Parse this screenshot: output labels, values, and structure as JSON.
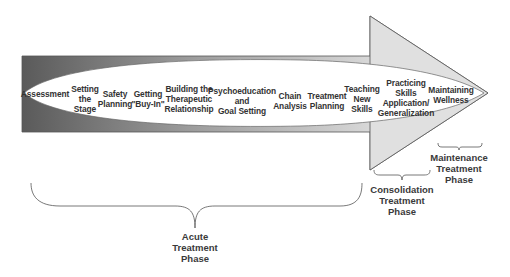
{
  "diagram": {
    "type": "arrow-process",
    "colors": {
      "shaft_dark": "#5f5f5f",
      "shaft_light": "#e6e6e6",
      "arrowhead_fill": "#e0e0e0",
      "ellipse_fill": "#ffffff",
      "outline": "#555555",
      "text": "#333333"
    },
    "steps": [
      {
        "label": "Assessment"
      },
      {
        "label": "Setting\nthe\nStage"
      },
      {
        "label": "Safety\nPlanning"
      },
      {
        "label": "Getting\n\"Buy-In\""
      },
      {
        "label": "Building the\nTherapeutic\nRelationship"
      },
      {
        "label": "Psychoeducation\nand\nGoal Setting"
      },
      {
        "label": "Chain\nAnalysis"
      },
      {
        "label": "Treatment\nPlanning"
      },
      {
        "label": "Teaching\nNew\nSkills"
      },
      {
        "label": "Practicing\nSkills\nApplication/\nGeneralization"
      },
      {
        "label": "Maintaining\nWellness"
      }
    ],
    "phases": [
      {
        "label": "Acute\nTreatment\nPhase"
      },
      {
        "label": "Consolidation\nTreatment\nPhase"
      },
      {
        "label": "Maintenance\nTreatment\nPhase"
      }
    ]
  }
}
